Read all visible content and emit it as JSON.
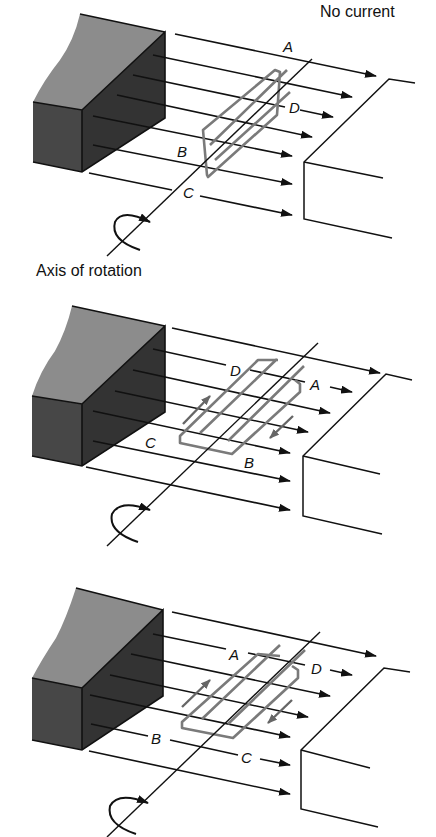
{
  "figure": {
    "panels": [
      {
        "id": "panel-1",
        "caption_top": "No current",
        "caption_bottom": "Axis of rotation",
        "labels": {
          "A": "A",
          "B": "B",
          "C": "C",
          "D": "D"
        },
        "current_arrows": false
      },
      {
        "id": "panel-2",
        "labels": {
          "A": "A",
          "B": "B",
          "C": "C",
          "D": "D"
        },
        "current_arrows": true
      },
      {
        "id": "panel-3",
        "labels": {
          "A": "A",
          "B": "B",
          "C": "C",
          "D": "D"
        },
        "current_arrows": true
      }
    ],
    "colors": {
      "magnet_top": "#8c8c8c",
      "magnet_front": "#474747",
      "magnet_side": "#333333",
      "field_lines": "#111111",
      "coil": "#7a7a7a"
    }
  }
}
